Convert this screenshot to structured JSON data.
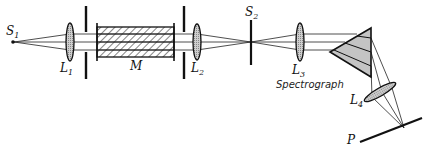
{
  "diagram": {
    "labels": {
      "source1": "S",
      "source1_sub": "1",
      "lens1": "L",
      "lens1_sub": "1",
      "medium": "M",
      "lens2": "L",
      "lens2_sub": "2",
      "slit2": "S",
      "slit2_sub": "2",
      "lens3": "L",
      "lens3_sub": "3",
      "spectrograph": "Spectrograph",
      "lens4": "L",
      "lens4_sub": "4",
      "plate": "P"
    },
    "components": [
      {
        "id": "S1",
        "type": "point-source"
      },
      {
        "id": "L1",
        "type": "converging-lens"
      },
      {
        "id": "aperture-1",
        "type": "slit-aperture"
      },
      {
        "id": "M",
        "type": "sample-cell"
      },
      {
        "id": "aperture-2",
        "type": "slit-aperture"
      },
      {
        "id": "L2",
        "type": "converging-lens"
      },
      {
        "id": "S2",
        "type": "slit"
      },
      {
        "id": "L3",
        "type": "collimating-lens"
      },
      {
        "id": "prism",
        "type": "dispersing-prism"
      },
      {
        "id": "L4",
        "type": "camera-lens"
      },
      {
        "id": "P",
        "type": "photographic-plate"
      }
    ],
    "colors": {
      "ink": "#111111",
      "lens_fill": "#b8b8b8",
      "prism_fill": "#c4c4c4",
      "background": "#ffffff"
    }
  }
}
